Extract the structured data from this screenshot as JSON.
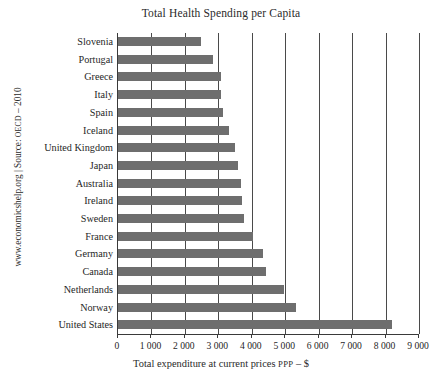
{
  "chart_data": {
    "type": "bar",
    "orientation": "horizontal",
    "title": "Total Health Spending per Capita",
    "xlabel_prefix": "Total expenditure at current prices ",
    "xlabel_small": "PPP",
    "xlabel_suffix": " – $",
    "xlabel": "Total expenditure at current prices PPP – $",
    "ylabel": "",
    "xlim": [
      0,
      9000
    ],
    "ylim": null,
    "grid": true,
    "grid_axis": "x",
    "legend": null,
    "legend_position": "none",
    "bar_color": "#6e6e6e",
    "gridline_color": "#4a4a4a",
    "axis_color": "#3a3a3a",
    "categories": [
      "Slovenia",
      "Portugal",
      "Greece",
      "Italy",
      "Spain",
      "Iceland",
      "United Kingdom",
      "Japan",
      "Australia",
      "Ireland",
      "Sweden",
      "France",
      "Germany",
      "Canada",
      "Netherlands",
      "Norway",
      "United States"
    ],
    "values": [
      2480,
      2840,
      3080,
      3080,
      3140,
      3320,
      3500,
      3590,
      3680,
      3710,
      3770,
      4040,
      4340,
      4430,
      4970,
      5330,
      8200
    ],
    "xticks": [
      0,
      1000,
      2000,
      3000,
      4000,
      5000,
      6000,
      7000,
      8000,
      9000
    ],
    "xtick_labels": [
      "0",
      "1 000",
      "2 000",
      "3 000",
      "4 000",
      "5 000",
      "6 000",
      "7 000",
      "8 000",
      "9 000"
    ]
  },
  "source_credit": {
    "prefix": "www.economicshelp.org | Source: ",
    "small": "OECD",
    "suffix": " – 2010",
    "full": "www.economicshelp.org | Source: OECD – 2010"
  }
}
